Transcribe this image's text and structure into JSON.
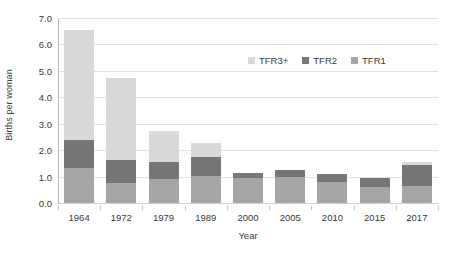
{
  "chart_data": {
    "type": "bar",
    "stacked": true,
    "title": "",
    "xlabel": "Year",
    "ylabel": "Births per woman",
    "categories": [
      "1964",
      "1972",
      "1979",
      "1989",
      "2000",
      "2005",
      "2010",
      "2015",
      "2017"
    ],
    "ylim": [
      0.0,
      7.0
    ],
    "ytick_labels": [
      "0.0",
      "1.0",
      "2.0",
      "3.0",
      "4.0",
      "5.0",
      "6.0",
      "7.0"
    ],
    "ytick_values": [
      0.0,
      1.0,
      2.0,
      3.0,
      4.0,
      5.0,
      6.0,
      7.0
    ],
    "grid": true,
    "grid_axis": "y",
    "legend_position": "inside-upper-right",
    "series": [
      {
        "name": "TFR1",
        "color": "#a6a6a6",
        "values": [
          1.32,
          0.75,
          0.9,
          1.04,
          0.93,
          0.98,
          0.78,
          0.62,
          0.63
        ]
      },
      {
        "name": "TFR2",
        "color": "#767676",
        "values": [
          1.07,
          0.89,
          0.64,
          0.72,
          0.22,
          0.27,
          0.32,
          0.31,
          0.82
        ]
      },
      {
        "name": "TFR3+",
        "color": "#d9d9d9",
        "values": [
          4.17,
          3.1,
          1.2,
          0.53,
          0.0,
          0.0,
          0.0,
          0.0,
          0.1
        ]
      }
    ],
    "stack_order_bottom_to_top": [
      "TFR1",
      "TFR2",
      "TFR3+"
    ],
    "totals": [
      6.56,
      4.74,
      2.74,
      2.29,
      1.15,
      1.25,
      1.1,
      0.93,
      1.55
    ],
    "legend": [
      {
        "label": "TFR3+",
        "color": "#d9d9d9"
      },
      {
        "label": "TFR2",
        "color": "#767676"
      },
      {
        "label": "TFR1",
        "color": "#a6a6a6"
      }
    ]
  },
  "colors": {
    "background": "#ffffff",
    "gridline": "#e2e2e2",
    "axis": "#b8b8b8",
    "text": "#3a3a3a"
  }
}
